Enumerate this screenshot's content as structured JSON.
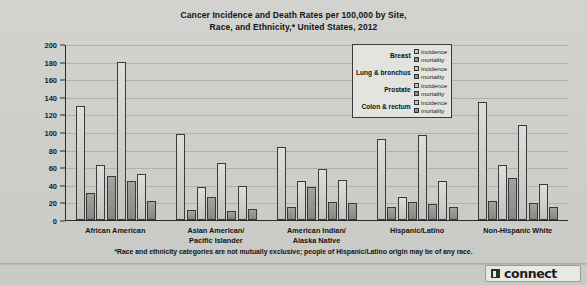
{
  "title": "Cancer Incidence and Death Rates per 100,000 by Site, Race, and Ethnicity,* United States, 2012",
  "title_line1": "Cancer Incidence and Death Rates per 100,000 by Site,",
  "title_line2": "Race, and Ethnicity,* United States, 2012",
  "footnote": "*Race and ethnicity categories are not mutually exclusive; people of Hispanic/Latino origin may be of any race.",
  "logo": {
    "text": "connect",
    "mark": "connect-logo-icon"
  },
  "legend": {
    "series_labels": [
      "incidence",
      "mortality"
    ],
    "sites": [
      "Breast",
      "Lung & bronchus",
      "Prostate",
      "Colon & rectum"
    ]
  },
  "colors": {
    "incidence": "#c3c3bf",
    "mortality": "#8e8e8a",
    "axis": "#2b2b2b",
    "grid": "#b0b0ac",
    "background": "#cfcfcb",
    "text": "#141414"
  },
  "chart_data": {
    "type": "bar",
    "title": "Cancer Incidence and Death Rates per 100,000 by Site, Race, and Ethnicity,* United States, 2012",
    "xlabel": "",
    "ylabel": "",
    "ylim": [
      0,
      200
    ],
    "yticks": [
      0,
      20,
      40,
      60,
      80,
      100,
      120,
      140,
      160,
      180,
      200
    ],
    "grid": true,
    "legend_position": "inside-top-right",
    "categories": [
      "African American",
      "Asian American/ Pacific Islander",
      "American Indian/ Alaska Native",
      "Hispanic/Latino",
      "Non-Hispanic White"
    ],
    "category_lines": [
      [
        "African American"
      ],
      [
        "Asian American/",
        "Pacific Islander"
      ],
      [
        "American Indian/",
        "Alaska Native"
      ],
      [
        "Hispanic/Latino"
      ],
      [
        "Non-Hispanic White"
      ]
    ],
    "series": [
      {
        "name": "Breast incidence",
        "site": "Breast",
        "measure": "incidence",
        "values": [
          129,
          98,
          83,
          92,
          134
        ]
      },
      {
        "name": "Breast mortality",
        "site": "Breast",
        "measure": "mortality",
        "values": [
          31,
          11,
          15,
          15,
          22
        ]
      },
      {
        "name": "Lung & bronchus incidence",
        "site": "Lung & bronchus",
        "measure": "incidence",
        "values": [
          63,
          38,
          44,
          26,
          62
        ]
      },
      {
        "name": "Lung & bronchus mortality",
        "site": "Lung & bronchus",
        "measure": "mortality",
        "values": [
          50,
          26,
          38,
          21,
          48
        ]
      },
      {
        "name": "Prostate incidence",
        "site": "Prostate",
        "measure": "incidence",
        "values": [
          180,
          65,
          58,
          97,
          108
        ]
      },
      {
        "name": "Prostate mortality",
        "site": "Prostate",
        "measure": "mortality",
        "values": [
          44,
          10,
          20,
          18,
          19
        ]
      },
      {
        "name": "Colon & rectum incidence",
        "site": "Colon & rectum",
        "measure": "incidence",
        "values": [
          52,
          39,
          45,
          44,
          41
        ]
      },
      {
        "name": "Colon & rectum mortality",
        "site": "Colon & rectum",
        "measure": "mortality",
        "values": [
          22,
          13,
          19,
          15,
          15
        ]
      }
    ]
  }
}
